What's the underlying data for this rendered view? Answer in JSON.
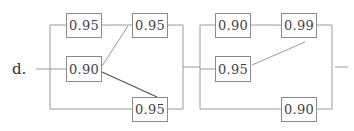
{
  "problem_label": "d.",
  "colors": {
    "line": "#9a9a9a",
    "box_border": "#8a8a8a",
    "text": "#444444"
  },
  "blocks": [
    {
      "name": "block-1",
      "components": [
        {
          "id": "A",
          "reliability": "0.95",
          "position": "top-left"
        },
        {
          "id": "B",
          "reliability": "0.90",
          "position": "middle-left"
        },
        {
          "id": "C",
          "reliability": "0.95",
          "position": "top-right"
        },
        {
          "id": "D",
          "reliability": "0.95",
          "position": "bottom-right"
        }
      ]
    },
    {
      "name": "block-2",
      "components": [
        {
          "id": "E",
          "reliability": "0.90",
          "position": "top-left"
        },
        {
          "id": "F",
          "reliability": "0.99",
          "position": "top-right"
        },
        {
          "id": "G",
          "reliability": "0.95",
          "position": "middle-left"
        },
        {
          "id": "H",
          "reliability": "0.90",
          "position": "bottom-right"
        }
      ]
    }
  ]
}
